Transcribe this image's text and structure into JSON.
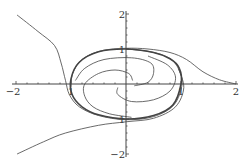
{
  "chart_data": {
    "type": "line",
    "title": "",
    "xlabel": "",
    "ylabel": "",
    "xlim": [
      -2,
      2
    ],
    "ylim": [
      -2,
      2
    ],
    "grid": false,
    "x_ticks": [
      -2,
      -1,
      1,
      2
    ],
    "x_tick_labels": [
      "−2",
      "1",
      "1",
      "2"
    ],
    "y_ticks": [
      2,
      1,
      -1,
      -2
    ],
    "y_tick_labels": [
      "2",
      "1",
      "1",
      "−2"
    ],
    "minor_ticks_per_unit": 5,
    "line_color": "#444444",
    "series": [
      {
        "name": "limit-cycle",
        "points": [
          [
            1.0,
            0
          ],
          [
            0.97,
            0.45
          ],
          [
            0.8,
            0.72
          ],
          [
            0.5,
            0.9
          ],
          [
            0,
            1.0
          ],
          [
            -0.5,
            0.92
          ],
          [
            -0.85,
            0.62
          ],
          [
            -1.0,
            0.15
          ],
          [
            -0.98,
            -0.3
          ],
          [
            -0.8,
            -0.65
          ],
          [
            -0.5,
            -0.88
          ],
          [
            0,
            -1.0
          ],
          [
            0.5,
            -0.9
          ],
          [
            0.85,
            -0.6
          ],
          [
            1.0,
            0
          ]
        ],
        "closed": true,
        "weight": "bold"
      },
      {
        "name": "trajectory-top-left",
        "points": [
          [
            -1.98,
            1.97
          ],
          [
            -1.6,
            1.5
          ],
          [
            -1.3,
            1.1
          ],
          [
            -1.18,
            0.6
          ],
          [
            -1.1,
            0.1
          ],
          [
            -1.03,
            -0.3
          ],
          [
            -0.85,
            -0.65
          ],
          [
            -0.5,
            -0.9
          ],
          [
            0,
            -1.02
          ],
          [
            0.5,
            -0.93
          ],
          [
            0.87,
            -0.6
          ],
          [
            1.02,
            0
          ],
          [
            0.95,
            0.45
          ],
          [
            0.78,
            0.75
          ],
          [
            0.45,
            0.92
          ],
          [
            0,
            1.0
          ]
        ]
      },
      {
        "name": "trajectory-bottom-left",
        "points": [
          [
            -1.98,
            -2.0
          ],
          [
            -1.5,
            -1.65
          ],
          [
            -1.1,
            -1.4
          ],
          [
            -0.5,
            -1.18
          ],
          [
            0,
            -1.08
          ],
          [
            0.5,
            -0.98
          ],
          [
            0.9,
            -0.65
          ],
          [
            1.05,
            -0.1
          ],
          [
            0.95,
            0.45
          ]
        ]
      },
      {
        "name": "trajectory-right",
        "points": [
          [
            2.0,
            0
          ],
          [
            1.7,
            0.12
          ],
          [
            1.4,
            0.35
          ],
          [
            1.1,
            0.7
          ],
          [
            0.8,
            0.9
          ],
          [
            0.4,
            1.0
          ],
          [
            0,
            1.02
          ],
          [
            -0.45,
            0.95
          ],
          [
            -0.8,
            0.7
          ],
          [
            -0.97,
            0.3
          ],
          [
            -1.0,
            -0.1
          ]
        ]
      },
      {
        "name": "inner-spiral-1",
        "points": [
          [
            0.12,
            0.1
          ],
          [
            0.05,
            0.3
          ],
          [
            -0.2,
            0.4
          ],
          [
            -0.5,
            0.3
          ],
          [
            -0.75,
            0.0
          ],
          [
            -0.75,
            -0.35
          ],
          [
            -0.6,
            -0.65
          ],
          [
            -0.3,
            -0.85
          ],
          [
            0.1,
            -0.95
          ]
        ]
      },
      {
        "name": "inner-spiral-2",
        "points": [
          [
            0.15,
            -0.05
          ],
          [
            0.4,
            0.05
          ],
          [
            0.5,
            0.3
          ],
          [
            0.45,
            0.6
          ],
          [
            0.1,
            0.75
          ],
          [
            -0.4,
            0.7
          ],
          [
            -0.75,
            0.45
          ],
          [
            -0.92,
            0.1
          ]
        ]
      },
      {
        "name": "inner-spiral-3",
        "points": [
          [
            -0.15,
            -0.1
          ],
          [
            -0.15,
            -0.3
          ],
          [
            0.1,
            -0.5
          ],
          [
            0.5,
            -0.45
          ],
          [
            0.8,
            -0.2
          ],
          [
            0.9,
            0.2
          ],
          [
            0.75,
            0.55
          ],
          [
            0.4,
            0.8
          ]
        ]
      }
    ]
  }
}
